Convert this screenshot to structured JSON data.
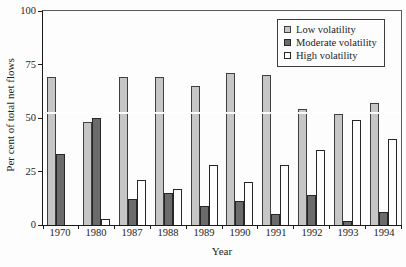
{
  "chart_data": {
    "type": "bar",
    "title": "",
    "categories": [
      "1970",
      "1980",
      "1987",
      "1988",
      "1989",
      "1990",
      "1991",
      "1992",
      "1993",
      "1994"
    ],
    "series": [
      {
        "name": "Low volatility",
        "color": "#c6c6c6",
        "border_color": "#3f3f3f",
        "values": [
          69,
          48,
          69,
          69,
          65,
          71,
          70,
          54,
          52,
          57
        ]
      },
      {
        "name": "Moderate volatility",
        "color": "#6b6b6b",
        "border_color": "#262626",
        "values": [
          33,
          50,
          12,
          15,
          9,
          11,
          5,
          14,
          2,
          6
        ]
      },
      {
        "name": "High volatility",
        "color": "#ffffff",
        "border_color": "#262626",
        "values": [
          0,
          3,
          21,
          17,
          28,
          20,
          28,
          35,
          49,
          40
        ]
      }
    ],
    "xlabel": "Year",
    "ylabel": "Per cent of total net flows",
    "ylim": [
      0,
      100
    ],
    "yticks": [
      0,
      25,
      50,
      75,
      100
    ],
    "legend_position": "top-right",
    "grid": false,
    "annotations": {
      "white_gridline_value": 52
    }
  }
}
